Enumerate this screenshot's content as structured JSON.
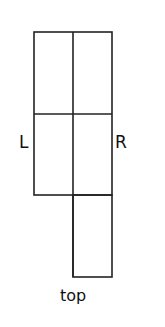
{
  "diagram": {
    "labels": {
      "left": "L",
      "right": "R",
      "bottom": "top"
    },
    "colors": {
      "line": "#222222",
      "background": "#ffffff"
    }
  }
}
